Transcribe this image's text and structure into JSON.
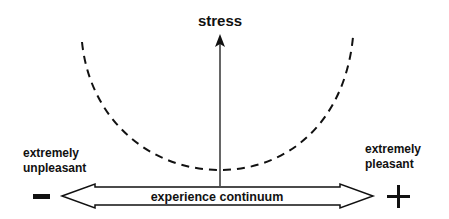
{
  "diagram": {
    "y_axis_label": "stress",
    "x_axis_label": "experience continuum",
    "left_pole": {
      "line1": "extremely",
      "line2": "unpleasant",
      "sign": "−"
    },
    "right_pole": {
      "line1": "extremely",
      "line2": "pleasant",
      "sign": "+"
    },
    "curve_style": "dashed U-shape",
    "colors": {
      "ink": "#111111",
      "background": "#ffffff"
    }
  }
}
